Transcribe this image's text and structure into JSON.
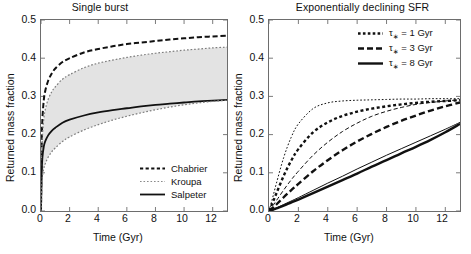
{
  "figure": {
    "width": 471,
    "height": 254,
    "background": "#ffffff",
    "ink": "#111111",
    "band_fill": "#e3e3e3"
  },
  "panels": [
    {
      "id": "single-burst",
      "title": "Single burst",
      "xlabel": "Time (Gyr)",
      "ylabel": "Returned mass fraction",
      "xlim": [
        0,
        13
      ],
      "ylim": [
        0.0,
        0.5
      ],
      "xticks": [
        0,
        2,
        4,
        6,
        8,
        10,
        12
      ],
      "xticklabels": [
        "0",
        "2",
        "4",
        "6",
        "8",
        "10",
        "12"
      ],
      "yticks": [
        0.0,
        0.1,
        0.2,
        0.3,
        0.4,
        0.5
      ],
      "yticklabels": [
        "0.0",
        "0.1",
        "0.2",
        "0.3",
        "0.4",
        "0.5"
      ],
      "legend": [
        {
          "label": "Chabrier",
          "style": "dashed"
        },
        {
          "label": "Kroupa",
          "style": "dotted"
        },
        {
          "label": "Salpeter",
          "style": "solid"
        }
      ]
    },
    {
      "id": "exponentially-declining-sfr",
      "title": "Exponentially declining SFR",
      "xlabel": "Time (Gyr)",
      "ylabel": "Returned mass fraction",
      "xlim": [
        0,
        13
      ],
      "ylim": [
        0.0,
        0.5
      ],
      "xticks": [
        0,
        2,
        4,
        6,
        8,
        10,
        12
      ],
      "xticklabels": [
        "0",
        "2",
        "4",
        "6",
        "8",
        "10",
        "12"
      ],
      "yticks": [
        0.0,
        0.1,
        0.2,
        0.3,
        0.4,
        0.5
      ],
      "yticklabels": [
        "0.0",
        "0.1",
        "0.2",
        "0.3",
        "0.4",
        "0.5"
      ],
      "legend": [
        {
          "label_prefix": "τ",
          "label_sub": "∗",
          "label_suffix": "= 1 Gyr",
          "style": "dotted"
        },
        {
          "label_prefix": "τ",
          "label_sub": "∗",
          "label_suffix": "= 3 Gyr",
          "style": "dashed"
        },
        {
          "label_prefix": "τ",
          "label_sub": "∗",
          "label_suffix": "= 8 Gyr",
          "style": "solid"
        }
      ]
    }
  ],
  "chart_data": [
    {
      "type": "line",
      "panel": "left",
      "title": "Single burst",
      "xlabel": "Time (Gyr)",
      "ylabel": "Returned mass fraction",
      "xlim": [
        0,
        13
      ],
      "ylim": [
        0.0,
        0.5
      ],
      "grid": false,
      "legend_position": "lower-right",
      "x": [
        0,
        0.05,
        0.1,
        0.2,
        0.3,
        0.5,
        0.75,
        1,
        1.5,
        2,
        3,
        4,
        5,
        6,
        7,
        8,
        9,
        10,
        11,
        12,
        13
      ],
      "series": [
        {
          "name": "Chabrier",
          "style": "dashed",
          "linewidth": 2,
          "values": [
            0.0,
            0.175,
            0.243,
            0.292,
            0.315,
            0.341,
            0.36,
            0.373,
            0.39,
            0.4,
            0.415,
            0.424,
            0.431,
            0.437,
            0.441,
            0.445,
            0.449,
            0.452,
            0.455,
            0.457,
            0.459
          ]
        },
        {
          "name": "Kroupa (upper envelope)",
          "style": "dotted",
          "linewidth": 1.2,
          "values": [
            0.0,
            0.14,
            0.196,
            0.243,
            0.266,
            0.292,
            0.312,
            0.325,
            0.345,
            0.357,
            0.375,
            0.387,
            0.395,
            0.402,
            0.408,
            0.413,
            0.417,
            0.421,
            0.424,
            0.427,
            0.429
          ]
        },
        {
          "name": "Salpeter",
          "style": "solid",
          "linewidth": 1.8,
          "values": [
            0.0,
            0.1,
            0.14,
            0.17,
            0.183,
            0.198,
            0.21,
            0.218,
            0.231,
            0.239,
            0.25,
            0.258,
            0.264,
            0.269,
            0.274,
            0.278,
            0.281,
            0.284,
            0.287,
            0.289,
            0.291
          ]
        },
        {
          "name": "Lower envelope (shaded band)",
          "style": "dotted",
          "linewidth": 1.2,
          "values": [
            0.0,
            0.063,
            0.09,
            0.112,
            0.124,
            0.141,
            0.155,
            0.165,
            0.182,
            0.194,
            0.212,
            0.226,
            0.238,
            0.248,
            0.257,
            0.265,
            0.272,
            0.278,
            0.283,
            0.287,
            0.29
          ]
        }
      ],
      "shaded_band": {
        "between": [
          "Kroupa (upper envelope)",
          "Lower envelope (shaded band)"
        ],
        "fill": "#e3e3e3"
      },
      "annotations": [
        "Chabrier asymptote ~0.46",
        "Kroupa upper asymptote ~0.43",
        "Salpeter asymptote ~0.29"
      ]
    },
    {
      "type": "line",
      "panel": "right",
      "title": "Exponentially declining SFR",
      "xlabel": "Time (Gyr)",
      "ylabel": "Returned mass fraction",
      "xlim": [
        0,
        13
      ],
      "ylim": [
        0.0,
        0.5
      ],
      "grid": false,
      "legend_position": "upper-right",
      "x": [
        0,
        0.25,
        0.5,
        1,
        1.5,
        2,
        3,
        4,
        5,
        6,
        7,
        8,
        9,
        10,
        11,
        12,
        13
      ],
      "series": [
        {
          "name": "tau* = 1 Gyr (thin)",
          "style": "dotted",
          "linewidth": 1.0,
          "values": [
            0.0,
            0.035,
            0.072,
            0.14,
            0.192,
            0.228,
            0.268,
            0.283,
            0.288,
            0.29,
            0.291,
            0.292,
            0.293,
            0.293,
            0.294,
            0.294,
            0.294
          ]
        },
        {
          "name": "tau* = 1 Gyr (thick)",
          "style": "dotted",
          "linewidth": 2.4,
          "values": [
            0.0,
            0.022,
            0.046,
            0.092,
            0.131,
            0.162,
            0.206,
            0.232,
            0.249,
            0.26,
            0.268,
            0.274,
            0.279,
            0.283,
            0.286,
            0.288,
            0.29
          ]
        },
        {
          "name": "tau* = 3 Gyr (thin)",
          "style": "dashed",
          "linewidth": 1.0,
          "values": [
            0.0,
            0.013,
            0.027,
            0.055,
            0.081,
            0.104,
            0.146,
            0.18,
            0.208,
            0.23,
            0.248,
            0.261,
            0.271,
            0.279,
            0.284,
            0.288,
            0.291
          ]
        },
        {
          "name": "tau* = 3 Gyr (thick)",
          "style": "dashed",
          "linewidth": 2.4,
          "values": [
            0.0,
            0.008,
            0.017,
            0.036,
            0.054,
            0.071,
            0.104,
            0.133,
            0.159,
            0.182,
            0.202,
            0.22,
            0.236,
            0.25,
            0.263,
            0.274,
            0.284
          ]
        },
        {
          "name": "tau* = 8 Gyr (thin)",
          "style": "solid",
          "linewidth": 1.0,
          "values": [
            0.0,
            0.004,
            0.008,
            0.017,
            0.026,
            0.035,
            0.054,
            0.073,
            0.091,
            0.11,
            0.128,
            0.146,
            0.163,
            0.18,
            0.197,
            0.214,
            0.232
          ]
        },
        {
          "name": "tau* = 8 Gyr (thick)",
          "style": "solid",
          "linewidth": 2.4,
          "values": [
            0.0,
            0.003,
            0.007,
            0.014,
            0.022,
            0.03,
            0.047,
            0.064,
            0.081,
            0.098,
            0.116,
            0.133,
            0.151,
            0.168,
            0.186,
            0.206,
            0.228
          ]
        }
      ],
      "annotations": [
        "All curves converge near 0.29 except tau*=8 Gyr which reaches ~0.23 at 13 Gyr"
      ]
    }
  ]
}
